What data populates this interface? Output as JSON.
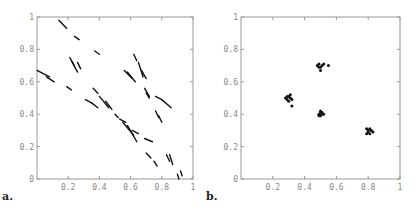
{
  "chart_data": [
    {
      "panel_label": "a.",
      "type": "line",
      "title": "",
      "xlabel": "",
      "ylabel": "",
      "xlim": [
        0,
        1
      ],
      "ylim": [
        0,
        1
      ],
      "grid": false,
      "x_ticks": [
        "0.2",
        "0.4",
        "0.6",
        "0.8",
        "1"
      ],
      "y_ticks": [
        "0",
        "0.2",
        "0.4",
        "0.6",
        "0.8",
        "1"
      ],
      "segments": [
        [
          [
            0.0,
            0.67
          ],
          [
            0.08,
            0.63
          ]
        ],
        [
          [
            0.06,
            0.63
          ],
          [
            0.11,
            0.6
          ]
        ],
        [
          [
            0.14,
            0.98
          ],
          [
            0.19,
            0.93
          ]
        ],
        [
          [
            0.24,
            0.88
          ],
          [
            0.27,
            0.86
          ]
        ],
        [
          [
            0.37,
            0.79
          ],
          [
            0.4,
            0.77
          ]
        ],
        [
          [
            0.21,
            0.75
          ],
          [
            0.24,
            0.7
          ]
        ],
        [
          [
            0.22,
            0.73
          ],
          [
            0.26,
            0.66
          ]
        ],
        [
          [
            0.26,
            0.72
          ],
          [
            0.28,
            0.68
          ]
        ],
        [
          [
            0.19,
            0.57
          ],
          [
            0.22,
            0.55
          ]
        ],
        [
          [
            0.36,
            0.56
          ],
          [
            0.39,
            0.53
          ]
        ],
        [
          [
            0.31,
            0.49
          ],
          [
            0.35,
            0.47
          ]
        ],
        [
          [
            0.35,
            0.47
          ],
          [
            0.39,
            0.44
          ]
        ],
        [
          [
            0.4,
            0.51
          ],
          [
            0.46,
            0.44
          ]
        ],
        [
          [
            0.44,
            0.48
          ],
          [
            0.48,
            0.43
          ]
        ],
        [
          [
            0.5,
            0.4
          ],
          [
            0.52,
            0.38
          ]
        ],
        [
          [
            0.53,
            0.37
          ],
          [
            0.57,
            0.35
          ]
        ],
        [
          [
            0.55,
            0.35
          ],
          [
            0.62,
            0.27
          ]
        ],
        [
          [
            0.58,
            0.33
          ],
          [
            0.64,
            0.23
          ]
        ],
        [
          [
            0.61,
            0.3
          ],
          [
            0.65,
            0.28
          ]
        ],
        [
          [
            0.69,
            0.25
          ],
          [
            0.74,
            0.23
          ]
        ],
        [
          [
            0.56,
            0.67
          ],
          [
            0.61,
            0.62
          ]
        ],
        [
          [
            0.58,
            0.66
          ],
          [
            0.63,
            0.6
          ]
        ],
        [
          [
            0.62,
            0.77
          ],
          [
            0.64,
            0.73
          ]
        ],
        [
          [
            0.65,
            0.72
          ],
          [
            0.68,
            0.63
          ]
        ],
        [
          [
            0.67,
            0.67
          ],
          [
            0.7,
            0.62
          ]
        ],
        [
          [
            0.69,
            0.56
          ],
          [
            0.72,
            0.51
          ]
        ],
        [
          [
            0.7,
            0.53
          ],
          [
            0.72,
            0.5
          ]
        ],
        [
          [
            0.76,
            0.51
          ],
          [
            0.8,
            0.49
          ]
        ],
        [
          [
            0.8,
            0.49
          ],
          [
            0.86,
            0.44
          ]
        ],
        [
          [
            0.76,
            0.42
          ],
          [
            0.78,
            0.38
          ]
        ],
        [
          [
            0.78,
            0.39
          ],
          [
            0.8,
            0.35
          ]
        ],
        [
          [
            0.7,
            0.16
          ],
          [
            0.73,
            0.13
          ]
        ],
        [
          [
            0.75,
            0.11
          ],
          [
            0.77,
            0.08
          ]
        ],
        [
          [
            0.83,
            0.15
          ],
          [
            0.85,
            0.11
          ]
        ],
        [
          [
            0.85,
            0.15
          ],
          [
            0.87,
            0.09
          ]
        ],
        [
          [
            0.9,
            0.03
          ],
          [
            0.91,
            0.0
          ]
        ],
        [
          [
            0.92,
            0.05
          ],
          [
            0.93,
            0.02
          ]
        ]
      ]
    },
    {
      "panel_label": "b.",
      "type": "scatter",
      "title": "",
      "xlabel": "",
      "ylabel": "",
      "xlim": [
        0,
        1
      ],
      "ylim": [
        0,
        1
      ],
      "grid": false,
      "x_ticks": [
        "0.2",
        "0.4",
        "0.6",
        "0.8",
        "1"
      ],
      "y_ticks": [
        "0",
        "0.2",
        "0.4",
        "0.6",
        "0.8",
        "1"
      ],
      "clusters": [
        {
          "center": [
            0.3,
            0.5
          ],
          "points": [
            [
              0.28,
              0.5
            ],
            [
              0.29,
              0.49
            ],
            [
              0.3,
              0.51
            ],
            [
              0.31,
              0.5
            ],
            [
              0.3,
              0.48
            ],
            [
              0.32,
              0.49
            ],
            [
              0.29,
              0.51
            ],
            [
              0.31,
              0.52
            ],
            [
              0.32,
              0.45
            ]
          ]
        },
        {
          "center": [
            0.5,
            0.7
          ],
          "points": [
            [
              0.48,
              0.7
            ],
            [
              0.49,
              0.71
            ],
            [
              0.5,
              0.69
            ],
            [
              0.49,
              0.69
            ],
            [
              0.51,
              0.7
            ],
            [
              0.5,
              0.67
            ],
            [
              0.52,
              0.71
            ],
            [
              0.55,
              0.7
            ]
          ]
        },
        {
          "center": [
            0.5,
            0.4
          ],
          "points": [
            [
              0.49,
              0.4
            ],
            [
              0.5,
              0.41
            ],
            [
              0.51,
              0.4
            ],
            [
              0.5,
              0.39
            ],
            [
              0.49,
              0.39
            ],
            [
              0.51,
              0.41
            ],
            [
              0.5,
              0.42
            ],
            [
              0.52,
              0.4
            ]
          ]
        },
        {
          "center": [
            0.8,
            0.3
          ],
          "points": [
            [
              0.79,
              0.31
            ],
            [
              0.8,
              0.3
            ],
            [
              0.81,
              0.31
            ],
            [
              0.8,
              0.29
            ],
            [
              0.82,
              0.3
            ],
            [
              0.79,
              0.28
            ],
            [
              0.81,
              0.28
            ],
            [
              0.83,
              0.29
            ]
          ]
        }
      ]
    }
  ]
}
